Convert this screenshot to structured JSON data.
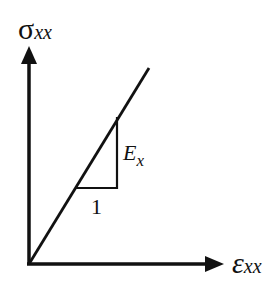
{
  "diagram": {
    "type": "stress-strain linear elastic plot",
    "y_axis": {
      "symbol": "σ",
      "subscript": "xx"
    },
    "x_axis": {
      "symbol": "ε",
      "subscript": "xx"
    },
    "slope_triangle": {
      "run_label": "1",
      "rise_symbol": "E",
      "rise_subscript": "x"
    },
    "colors": {
      "stroke": "#111111",
      "background": "#ffffff"
    }
  }
}
